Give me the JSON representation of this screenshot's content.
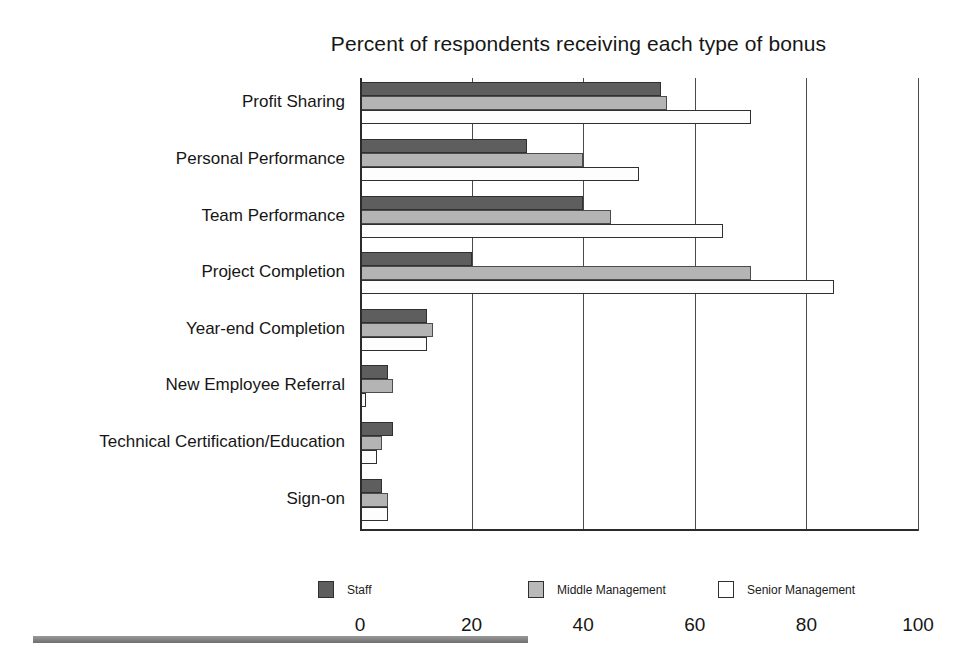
{
  "chart_data": {
    "type": "bar",
    "orientation": "horizontal",
    "title": "Percent of respondents receiving each type of bonus",
    "xlabel": "",
    "ylabel": "",
    "xlim": [
      0,
      100
    ],
    "xticks": [
      "0",
      "20",
      "40",
      "60",
      "80",
      "100"
    ],
    "grid": true,
    "legend_position": "bottom",
    "categories": [
      "Profit Sharing",
      "Personal Performance",
      "Team Performance",
      "Project Completion",
      "Year-end Completion",
      "New Employee Referral",
      "Technical Certification/Education",
      "Sign-on"
    ],
    "series": [
      {
        "name": "Staff",
        "color": "#5e5e5e",
        "values": [
          54,
          30,
          40,
          20,
          12,
          5,
          6,
          4
        ]
      },
      {
        "name": "Middle Management",
        "color": "#b4b4b4",
        "values": [
          55,
          40,
          45,
          70,
          13,
          6,
          4,
          5
        ]
      },
      {
        "name": "Senior Management",
        "color": "#ffffff",
        "values": [
          70,
          50,
          65,
          85,
          12,
          1,
          3,
          5
        ]
      }
    ]
  },
  "legend": {
    "items": [
      {
        "label": "Staff",
        "swatch": "staff"
      },
      {
        "label": "Middle Management",
        "swatch": "middle"
      },
      {
        "label": "Senior Management",
        "swatch": "senior"
      }
    ]
  }
}
